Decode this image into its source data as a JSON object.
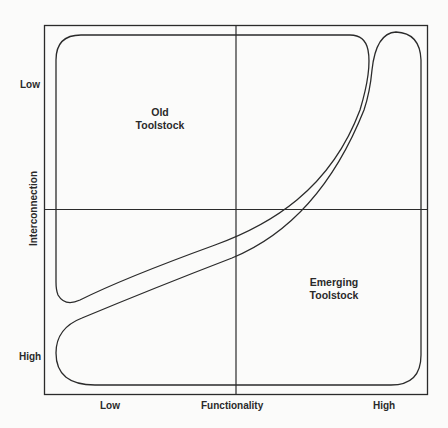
{
  "diagram": {
    "type": "quadrant-region-diagram",
    "x_axis": {
      "title": "Functionality",
      "low_label": "Low",
      "high_label": "High"
    },
    "y_axis": {
      "title": "Interconnection",
      "top_label": "Low",
      "bottom_label": "High"
    },
    "regions": [
      {
        "id": "old",
        "label_line1": "Old",
        "label_line2": "Toolstock",
        "position": "upper-left"
      },
      {
        "id": "emerging",
        "label_line1": "Emerging",
        "label_line2": "Toolstock",
        "position": "lower-right"
      }
    ],
    "colors": {
      "line": "#2b2b2b",
      "background": "#fbfbfa"
    }
  }
}
